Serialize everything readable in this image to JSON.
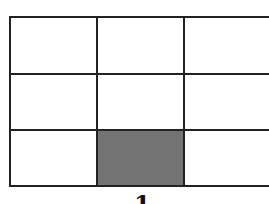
{
  "diagram": {
    "type": "grid",
    "rows": 3,
    "columns": 3,
    "shaded_cells": [
      {
        "row": 3,
        "col": 2
      }
    ],
    "colors": {
      "line": "#222222",
      "shaded": "#8a8a8a",
      "background": "#ffffff"
    },
    "caption": "1"
  }
}
